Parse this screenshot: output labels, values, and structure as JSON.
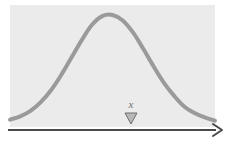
{
  "figure": {
    "type": "normal-distribution-diagram",
    "caption_label": "x",
    "panel": {
      "background_color": "#ebebeb",
      "x": 10,
      "y": 5,
      "width": 205,
      "height": 122
    },
    "curve": {
      "name": "bell-curve",
      "color": "#9a9a9a",
      "stroke_width": 4,
      "peak_x": 105,
      "peak_y": 15,
      "baseline_y": 124
    },
    "axis": {
      "name": "x-axis-arrow",
      "color": "#4a4a4a",
      "stroke_width": 2,
      "start_x": 8,
      "end_x": 222,
      "y": 130,
      "arrowhead": "right"
    },
    "marker": {
      "name": "value-marker",
      "shape": "triangle-down",
      "fill_color": "#b8b8b8",
      "stroke_color": "#6f6f6f",
      "center_x": 131,
      "top_y": 113,
      "bottom_y": 124,
      "half_width": 6
    }
  },
  "chart_data": {
    "type": "line",
    "title": "",
    "xlabel": "x",
    "ylabel": "",
    "grid": false,
    "legend": null,
    "annotations": [
      {
        "text": "x",
        "marker": "triangle-down",
        "x": 0.59,
        "note": "marker placed on the x-axis to the right of the distribution peak"
      }
    ],
    "distribution": "normal",
    "mean": 0.465,
    "stddev": 0.2,
    "x": [
      0.0,
      0.05,
      0.1,
      0.15,
      0.2,
      0.25,
      0.3,
      0.35,
      0.4,
      0.45,
      0.5,
      0.55,
      0.6,
      0.65,
      0.7,
      0.75,
      0.8,
      0.85,
      0.9,
      0.95,
      1.0
    ],
    "values": [
      0.04,
      0.07,
      0.12,
      0.2,
      0.31,
      0.45,
      0.61,
      0.77,
      0.91,
      0.99,
      1.0,
      0.95,
      0.84,
      0.69,
      0.53,
      0.38,
      0.26,
      0.16,
      0.1,
      0.06,
      0.03
    ],
    "xlim": [
      0,
      1
    ],
    "ylim": [
      0,
      1
    ]
  }
}
